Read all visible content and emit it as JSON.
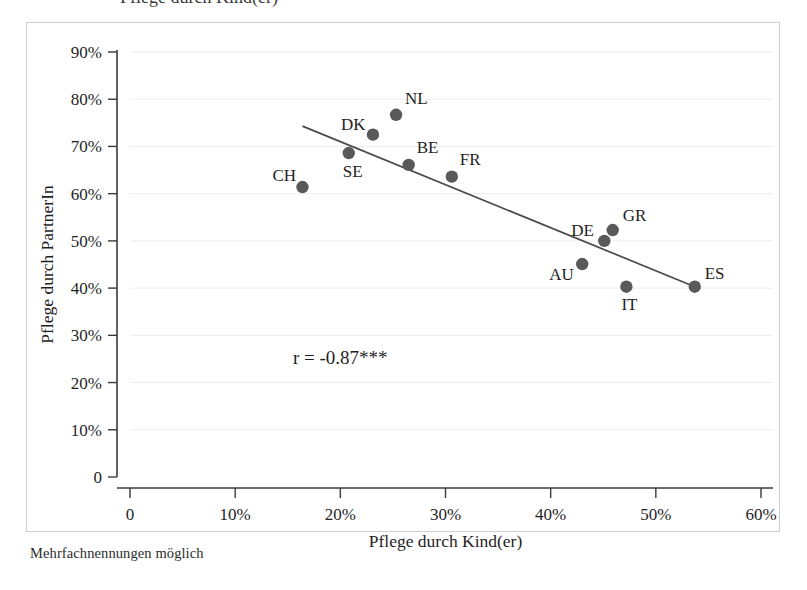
{
  "figure": {
    "footnote": "Mehrfachnennungen möglich",
    "cropped_title": "Pflege durch Kind(er)"
  },
  "chart_data": {
    "type": "scatter",
    "title": "",
    "xlabel": "Pflege durch Kind(er)",
    "ylabel": "Pflege durch PartnerIn",
    "xlim": [
      0,
      60
    ],
    "ylim": [
      0,
      90
    ],
    "xticks": [
      0,
      10,
      20,
      30,
      40,
      50,
      60
    ],
    "yticks": [
      0,
      10,
      20,
      30,
      40,
      50,
      60,
      70,
      80,
      90
    ],
    "xtick_labels": [
      "0",
      "10%",
      "20%",
      "30%",
      "40%",
      "50%",
      "60%"
    ],
    "ytick_labels": [
      "0",
      "10%",
      "20%",
      "30%",
      "40%",
      "50%",
      "60%",
      "70%",
      "80%",
      "90%"
    ],
    "grid": true,
    "legend": "none",
    "annotation": "r = -0.87***",
    "annotation_x": 15.5,
    "annotation_y": 24.0,
    "marker_color": "#595959",
    "fit_line_color": "#4a4a4a",
    "grid_color": "#ededf1",
    "axis_color": "#3a3a3a",
    "points": [
      {
        "label": "CH",
        "x": 16.4,
        "y": 61.4,
        "label_dx": -30,
        "label_dy": -6
      },
      {
        "label": "SE",
        "x": 20.8,
        "y": 68.6,
        "label_dx": -6,
        "label_dy": 24
      },
      {
        "label": "DK",
        "x": 23.1,
        "y": 72.5,
        "label_dx": -32,
        "label_dy": -5
      },
      {
        "label": "NL",
        "x": 25.3,
        "y": 76.7,
        "label_dx": 9,
        "label_dy": -11
      },
      {
        "label": "BE",
        "x": 26.5,
        "y": 66.1,
        "label_dx": 8,
        "label_dy": -12
      },
      {
        "label": "FR",
        "x": 30.6,
        "y": 63.6,
        "label_dx": 8,
        "label_dy": -12
      },
      {
        "label": "AU",
        "x": 43.0,
        "y": 45.1,
        "label_dx": -33,
        "label_dy": 16
      },
      {
        "label": "DE",
        "x": 45.1,
        "y": 50.0,
        "label_dx": -33,
        "label_dy": -5
      },
      {
        "label": "GR",
        "x": 45.9,
        "y": 52.3,
        "label_dx": 10,
        "label_dy": -9
      },
      {
        "label": "IT",
        "x": 47.2,
        "y": 40.3,
        "label_dx": -5,
        "label_dy": 23
      },
      {
        "label": "ES",
        "x": 53.7,
        "y": 40.3,
        "label_dx": 10,
        "label_dy": -8
      }
    ],
    "fit_line": {
      "x0": 16.4,
      "y0": 74.3,
      "x1": 53.7,
      "y1": 40.3
    },
    "correlation": -0.87,
    "significance": "***"
  }
}
